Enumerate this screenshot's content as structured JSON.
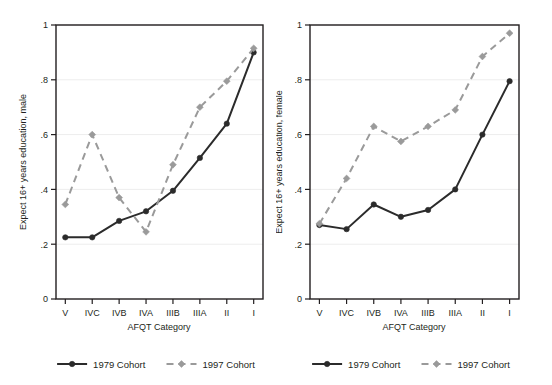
{
  "figure": {
    "title": "",
    "panel_count": 2
  },
  "chart_data": [
    {
      "type": "line",
      "title": "",
      "panel": "male",
      "xlabel": "AFQT Category",
      "ylabel": "Expect 16+ years education, male",
      "categories": [
        "V",
        "IVC",
        "IVB",
        "IVA",
        "IIIB",
        "IIIA",
        "II",
        "I"
      ],
      "ylim": [
        0,
        1
      ],
      "xlim": [
        0,
        7
      ],
      "yticks": [
        "0",
        ".2",
        ".4",
        ".6",
        ".8",
        "1"
      ],
      "ytick_values": [
        0,
        0.2,
        0.4,
        0.6,
        0.8,
        1
      ],
      "grid": "horizontal",
      "legend_position": "bottom",
      "series": [
        {
          "name": "1979 Cohort",
          "style": "solid",
          "color": "#2b2b2b",
          "marker": "circle",
          "values": [
            0.225,
            0.225,
            0.285,
            0.32,
            0.395,
            0.515,
            0.64,
            0.9
          ]
        },
        {
          "name": "1997 Cohort",
          "style": "dashed",
          "color": "#9a9a9a",
          "marker": "diamond",
          "values": [
            0.345,
            0.6,
            0.37,
            0.245,
            0.49,
            0.7,
            0.795,
            0.915
          ]
        }
      ]
    },
    {
      "type": "line",
      "title": "",
      "panel": "female",
      "xlabel": "AFQT Category",
      "ylabel": "Expect 16+ years education, female",
      "categories": [
        "V",
        "IVC",
        "IVB",
        "IVA",
        "IIIB",
        "IIIA",
        "II",
        "I"
      ],
      "ylim": [
        0,
        1
      ],
      "xlim": [
        0,
        7
      ],
      "yticks": [
        "0",
        ".2",
        ".4",
        ".6",
        ".8",
        "1"
      ],
      "ytick_values": [
        0,
        0.2,
        0.4,
        0.6,
        0.8,
        1
      ],
      "grid": "horizontal",
      "legend_position": "bottom",
      "series": [
        {
          "name": "1979 Cohort",
          "style": "solid",
          "color": "#2b2b2b",
          "marker": "circle",
          "values": [
            0.27,
            0.255,
            0.345,
            0.3,
            0.325,
            0.4,
            0.6,
            0.795
          ]
        },
        {
          "name": "1997 Cohort",
          "style": "dashed",
          "color": "#9a9a9a",
          "marker": "diamond",
          "values": [
            0.275,
            0.44,
            0.63,
            0.575,
            0.63,
            0.69,
            0.885,
            0.97
          ]
        }
      ]
    }
  ],
  "legend": {
    "entries": [
      {
        "label": "1979 Cohort",
        "style": "solid",
        "color": "#2b2b2b"
      },
      {
        "label": "1997 Cohort",
        "style": "dashed",
        "color": "#9a9a9a"
      }
    ]
  },
  "colors": {
    "cohort_1979": "#2b2b2b",
    "cohort_1997": "#9a9a9a",
    "axis": "#231f20",
    "gridline": "#ededed",
    "background": "#ffffff"
  }
}
